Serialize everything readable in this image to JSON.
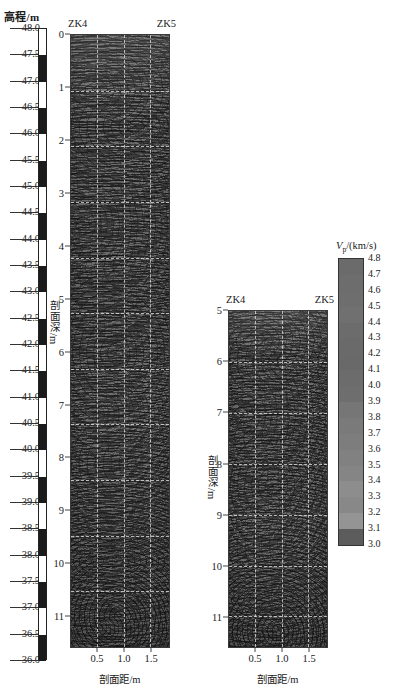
{
  "chart_data": {
    "type": "heatmap",
    "title": "",
    "subtitle": "",
    "colorbar": {
      "label_plain": "Vp/(km/s)",
      "symbol": "V",
      "subscript": "p",
      "unit": "/(km/s)",
      "min": 3.0,
      "max": 4.8,
      "step": 0.1,
      "ticks": [
        "4.8",
        "4.7",
        "4.6",
        "4.5",
        "4.4",
        "4.3",
        "4.2",
        "4.1",
        "4.0",
        "3.9",
        "3.8",
        "3.7",
        "3.6",
        "3.5",
        "3.4",
        "3.3",
        "3.2",
        "3.1",
        "3.0"
      ],
      "colormap": "grayscale",
      "swatches": [
        "#6b6b6b",
        "#6d6d6d",
        "#6e6e6e",
        "#707070",
        "#6c6c6c",
        "#6a6a6a",
        "#696969",
        "#6c6c6c",
        "#6e6e6e",
        "#767676",
        "#7a7a7a",
        "#7d7d7d",
        "#818181",
        "#858585",
        "#8d8d8d",
        "#888888",
        "#949494",
        "#5c5c5c",
        "#8a8a8a"
      ]
    },
    "elevation_scale": {
      "title": "高程/m",
      "unit": "m",
      "max": 48.0,
      "min": 36.0,
      "step": 0.5,
      "ticks": [
        "48.0",
        "47.5",
        "47.0",
        "46.5",
        "46.0",
        "45.5",
        "45.0",
        "44.5",
        "44.0",
        "43.5",
        "43.0",
        "42.5",
        "42.0",
        "41.5",
        "41.0",
        "40.5",
        "40.0",
        "39.5",
        "39.0",
        "38.5",
        "38.0",
        "37.5",
        "37.0",
        "36.5",
        "36.0"
      ],
      "pattern": "alternating-black-white",
      "dark_color": "#1b1b1b",
      "light_color": "#ffffff"
    },
    "panels": [
      {
        "id": "panel-left",
        "borehole_left": "ZK4",
        "borehole_right": "ZK5",
        "y_axis_title": "剖面深/m",
        "x_axis_title": "剖面距/m",
        "y_ticks": [
          "0",
          "1",
          "2",
          "3",
          "4",
          "5",
          "6",
          "7",
          "8",
          "9",
          "10",
          "11"
        ],
        "y_min": 0,
        "y_max": 11.6,
        "x_ticks": [
          "0.5",
          "1.0",
          "1.5"
        ],
        "x_min": 0.0,
        "x_max": 1.85,
        "grid": true
      },
      {
        "id": "panel-right",
        "borehole_left": "ZK4",
        "borehole_right": "ZK5",
        "y_axis_title": "剖面深/m",
        "x_axis_title": "剖面距/m",
        "y_ticks": [
          "5",
          "6",
          "7",
          "8",
          "9",
          "10",
          "11"
        ],
        "y_min": 5,
        "y_max": 11.6,
        "x_ticks": [
          "0.5",
          "1.0",
          "1.5"
        ],
        "x_min": 0.0,
        "x_max": 1.85,
        "grid": true
      }
    ]
  }
}
